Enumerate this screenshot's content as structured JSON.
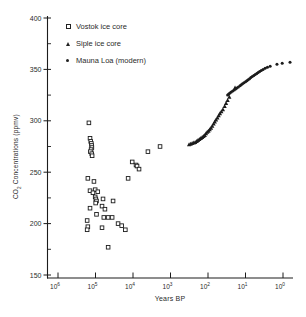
{
  "figure": {
    "background": "#ffffff",
    "ink_color": "#2b2b2b",
    "marker_color": "#1c1c1c"
  },
  "legend": {
    "items": [
      {
        "label": "Vostok ice core",
        "marker": "open-square"
      },
      {
        "label": "Siple ice core",
        "marker": "filled-triangle"
      },
      {
        "label": "Mauna Loa (modern)",
        "marker": "filled-dot"
      }
    ]
  },
  "chart_data": {
    "type": "scatter",
    "title": "",
    "xlabel": "Years BP",
    "ylabel": "CO2 Concentrations (ppmv)",
    "ylabel_parts": {
      "prefix": "CO",
      "sub": "2",
      "suffix": " Concentrations (ppmv)"
    },
    "x_axis": {
      "scale": "log-reversed",
      "tick_labels": [
        "10^6",
        "10^5",
        "10^4",
        "10^3",
        "10^2",
        "10^1",
        "10^0"
      ],
      "range_log10": [
        6,
        0
      ],
      "grid": false
    },
    "y_axis": {
      "major_ticks": [
        150,
        200,
        250,
        300,
        350,
        400
      ],
      "minor_ticks": [
        175,
        225,
        275,
        325,
        375
      ],
      "range": [
        150,
        400
      ],
      "grid": false
    },
    "series": [
      {
        "name": "Vostok ice core",
        "marker": "open-square",
        "points": [
          [
            150000,
            298
          ],
          [
            140000,
            283
          ],
          [
            134000,
            280
          ],
          [
            129000,
            278
          ],
          [
            127000,
            276
          ],
          [
            125000,
            274
          ],
          [
            131000,
            272
          ],
          [
            137000,
            270
          ],
          [
            126000,
            268
          ],
          [
            123000,
            266
          ],
          [
            4000,
            270
          ],
          [
            1900,
            275
          ],
          [
            10500,
            260
          ],
          [
            8300,
            257
          ],
          [
            7800,
            256
          ],
          [
            6900,
            253
          ],
          [
            13500,
            244
          ],
          [
            160000,
            244
          ],
          [
            110000,
            241
          ],
          [
            140000,
            232
          ],
          [
            102000,
            233
          ],
          [
            87000,
            231
          ],
          [
            117000,
            230
          ],
          [
            102000,
            226
          ],
          [
            98000,
            224
          ],
          [
            94000,
            222
          ],
          [
            99000,
            220
          ],
          [
            63000,
            224
          ],
          [
            34000,
            222
          ],
          [
            140000,
            215
          ],
          [
            67000,
            217
          ],
          [
            56000,
            214
          ],
          [
            94000,
            209
          ],
          [
            60000,
            206
          ],
          [
            46000,
            206
          ],
          [
            36000,
            206
          ],
          [
            167000,
            203
          ],
          [
            25000,
            200
          ],
          [
            20000,
            198
          ],
          [
            160000,
            197
          ],
          [
            167000,
            194
          ],
          [
            67000,
            196
          ],
          [
            16000,
            194
          ],
          [
            46000,
            177
          ]
        ]
      },
      {
        "name": "Siple ice core",
        "marker": "filled-triangle",
        "points": [
          [
            320,
            277
          ],
          [
            290,
            277.5
          ],
          [
            265,
            278
          ],
          [
            240,
            278.5
          ],
          [
            220,
            279
          ],
          [
            200,
            280
          ],
          [
            185,
            281
          ],
          [
            170,
            282
          ],
          [
            155,
            283
          ],
          [
            143,
            284
          ],
          [
            132,
            285
          ],
          [
            122,
            286
          ],
          [
            113,
            287.5
          ],
          [
            105,
            289
          ],
          [
            97,
            290
          ],
          [
            90,
            291.5
          ],
          [
            83,
            293
          ],
          [
            77,
            295
          ],
          [
            71,
            297
          ],
          [
            66,
            299
          ],
          [
            61,
            301
          ],
          [
            56,
            303
          ],
          [
            52,
            305
          ],
          [
            48,
            307
          ],
          [
            44,
            309
          ],
          [
            40,
            311
          ],
          [
            36,
            314
          ],
          [
            33,
            317
          ],
          [
            30,
            320
          ],
          [
            27,
            323
          ],
          [
            19,
            332
          ]
        ]
      },
      {
        "name": "Mauna Loa (modern)",
        "marker": "filled-dot",
        "points": [
          [
            30,
            325
          ],
          [
            28,
            326
          ],
          [
            26,
            327
          ],
          [
            24,
            328
          ],
          [
            22,
            329
          ],
          [
            20,
            330
          ],
          [
            18.5,
            331
          ],
          [
            17,
            332
          ],
          [
            15.5,
            333
          ],
          [
            14,
            334
          ],
          [
            13,
            335
          ],
          [
            12,
            336
          ],
          [
            11,
            337
          ],
          [
            10,
            338
          ],
          [
            9.2,
            339
          ],
          [
            8.5,
            340
          ],
          [
            7.8,
            341
          ],
          [
            7.2,
            342
          ],
          [
            6.6,
            343
          ],
          [
            6,
            344
          ],
          [
            5.5,
            345
          ],
          [
            5,
            346
          ],
          [
            4.6,
            347
          ],
          [
            4.2,
            348
          ],
          [
            3.8,
            349
          ],
          [
            3.4,
            350
          ],
          [
            3,
            351
          ],
          [
            2.6,
            352
          ],
          [
            2.2,
            353
          ],
          [
            1.45,
            355
          ],
          [
            1.05,
            356
          ],
          [
            0.65,
            357
          ]
        ]
      }
    ]
  }
}
